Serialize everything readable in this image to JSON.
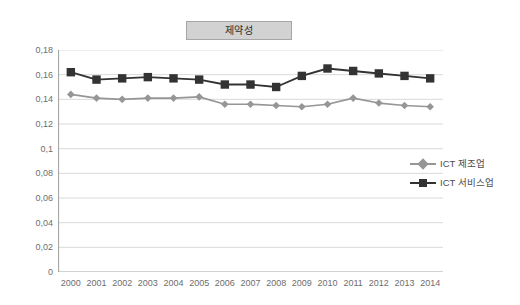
{
  "title": {
    "text": "제약성"
  },
  "legend": {
    "position": "right",
    "items": [
      {
        "label": "ICT 제조업",
        "color": "#969696",
        "marker": "diamond"
      },
      {
        "label": "ICT 서비스업",
        "color": "#333333",
        "marker": "square"
      }
    ]
  },
  "axes": {
    "y_ticks": [
      "0,18",
      "0,16",
      "0,14",
      "0,12",
      "0,1",
      "0,08",
      "0,06",
      "0,04",
      "0,02",
      "0"
    ],
    "x_ticks": [
      "2000",
      "2001",
      "2002",
      "2003",
      "2004",
      "2005",
      "2006",
      "2007",
      "2008",
      "2009",
      "2010",
      "2011",
      "2012",
      "2013",
      "2014"
    ]
  },
  "colors": {
    "series_manufacturing": "#969696",
    "series_services": "#333333",
    "gridline": "#d9d9d9",
    "axis": "#a6a6a6",
    "title_box_fill": "#d2d2d2",
    "title_box_border": "#a6a6a6",
    "text": "#6e6e6e",
    "background": "#ffffff"
  },
  "chart_data": {
    "type": "line",
    "title": "제약성",
    "xlabel": "",
    "ylabel": "",
    "ylim": [
      0,
      0.18
    ],
    "ytick_step": 0.02,
    "grid": true,
    "legend_position": "right",
    "categories": [
      "2000",
      "2001",
      "2002",
      "2003",
      "2004",
      "2005",
      "2006",
      "2007",
      "2008",
      "2009",
      "2010",
      "2011",
      "2012",
      "2013",
      "2014"
    ],
    "series": [
      {
        "name": "ICT 제조업",
        "color": "#969696",
        "marker": "diamond",
        "values": [
          0.144,
          0.141,
          0.14,
          0.141,
          0.141,
          0.142,
          0.136,
          0.136,
          0.135,
          0.134,
          0.136,
          0.141,
          0.137,
          0.135,
          0.134
        ]
      },
      {
        "name": "ICT 서비스업",
        "color": "#333333",
        "marker": "square",
        "values": [
          0.162,
          0.156,
          0.157,
          0.158,
          0.157,
          0.156,
          0.152,
          0.152,
          0.15,
          0.159,
          0.165,
          0.163,
          0.161,
          0.159,
          0.157
        ]
      }
    ]
  }
}
